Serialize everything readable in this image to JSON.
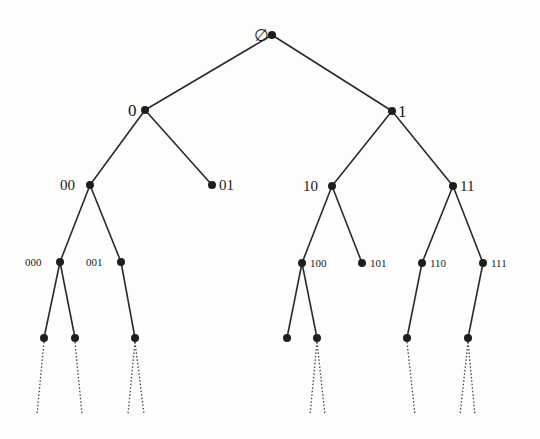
{
  "diagram": {
    "type": "binary-tree",
    "nodes": [
      {
        "id": "root",
        "label": "∅",
        "x": 272,
        "y": 35,
        "label_x": 254,
        "label_y": 41,
        "cls": "l1"
      },
      {
        "id": "n0",
        "label": "0",
        "x": 145,
        "y": 110,
        "label_x": 128,
        "label_y": 116,
        "cls": "l1"
      },
      {
        "id": "n1",
        "label": "1",
        "x": 392,
        "y": 111,
        "label_x": 398,
        "label_y": 117,
        "cls": "l1"
      },
      {
        "id": "n00",
        "label": "00",
        "x": 90,
        "y": 185,
        "label_x": 60,
        "label_y": 190,
        "cls": "l2"
      },
      {
        "id": "n01",
        "label": "01",
        "x": 212,
        "y": 185,
        "label_x": 219,
        "label_y": 190,
        "cls": "l2"
      },
      {
        "id": "n10",
        "label": "10",
        "x": 332,
        "y": 186,
        "label_x": 303,
        "label_y": 191,
        "cls": "l2"
      },
      {
        "id": "n11",
        "label": "11",
        "x": 453,
        "y": 186,
        "label_x": 460,
        "label_y": 191,
        "cls": "l2"
      },
      {
        "id": "n000",
        "label": "000",
        "x": 60,
        "y": 262,
        "label_x": 25,
        "label_y": 266,
        "cls": "l3"
      },
      {
        "id": "n001",
        "label": "001",
        "x": 121,
        "y": 262,
        "label_x": 86,
        "label_y": 266,
        "cls": "l3"
      },
      {
        "id": "n100",
        "label": "100",
        "x": 302,
        "y": 263,
        "label_x": 310,
        "label_y": 267,
        "cls": "l3"
      },
      {
        "id": "n101",
        "label": "101",
        "x": 362,
        "y": 263,
        "label_x": 370,
        "label_y": 267,
        "cls": "l3"
      },
      {
        "id": "n110",
        "label": "110",
        "x": 422,
        "y": 263,
        "label_x": 430,
        "label_y": 267,
        "cls": "l3"
      },
      {
        "id": "n111",
        "label": "111",
        "x": 483,
        "y": 263,
        "label_x": 491,
        "label_y": 267,
        "cls": "l3"
      },
      {
        "id": "n0000",
        "label": "",
        "x": 44,
        "y": 338
      },
      {
        "id": "n0001",
        "label": "",
        "x": 75,
        "y": 338
      },
      {
        "id": "n0010",
        "label": "",
        "x": 135,
        "y": 338
      },
      {
        "id": "n1000",
        "label": "",
        "x": 287,
        "y": 338
      },
      {
        "id": "n1001",
        "label": "",
        "x": 317,
        "y": 338
      },
      {
        "id": "n1100",
        "label": "",
        "x": 407,
        "y": 338
      },
      {
        "id": "n1110",
        "label": "",
        "x": 468,
        "y": 338
      }
    ],
    "edges": [
      [
        "root",
        "n0"
      ],
      [
        "root",
        "n1"
      ],
      [
        "n0",
        "n00"
      ],
      [
        "n0",
        "n01"
      ],
      [
        "n1",
        "n10"
      ],
      [
        "n1",
        "n11"
      ],
      [
        "n00",
        "n000"
      ],
      [
        "n00",
        "n001"
      ],
      [
        "n10",
        "n100"
      ],
      [
        "n10",
        "n101"
      ],
      [
        "n11",
        "n110"
      ],
      [
        "n11",
        "n111"
      ],
      [
        "n000",
        "n0000"
      ],
      [
        "n000",
        "n0001"
      ],
      [
        "n001",
        "n0010"
      ],
      [
        "n100",
        "n1000"
      ],
      [
        "n100",
        "n1001"
      ],
      [
        "n110",
        "n1100"
      ],
      [
        "n111",
        "n1110"
      ]
    ],
    "continuations": [
      {
        "from": "n0000",
        "to_x": 37,
        "to_y": 414
      },
      {
        "from": "n0001",
        "to_x": 82,
        "to_y": 414
      },
      {
        "from": "n0010",
        "to_x": 128,
        "to_y": 414
      },
      {
        "from": "n0010",
        "to_x": 144,
        "to_y": 414
      },
      {
        "from": "n1001",
        "to_x": 310,
        "to_y": 415
      },
      {
        "from": "n1001",
        "to_x": 325,
        "to_y": 415
      },
      {
        "from": "n1100",
        "to_x": 415,
        "to_y": 415
      },
      {
        "from": "n1110",
        "to_x": 460,
        "to_y": 415
      },
      {
        "from": "n1110",
        "to_x": 475,
        "to_y": 415
      }
    ]
  }
}
